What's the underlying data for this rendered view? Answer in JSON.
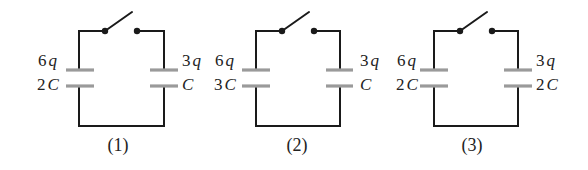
{
  "diagram": {
    "type": "capacitor circuits with open switch",
    "circuits": [
      {
        "caption": "(1)",
        "left": {
          "charge_num": "6",
          "charge_var": "q",
          "cap_num": "2",
          "cap_var": "C"
        },
        "right": {
          "charge_num": "3",
          "charge_var": "q",
          "cap_num": "",
          "cap_var": "C"
        },
        "switch": "open"
      },
      {
        "caption": "(2)",
        "left": {
          "charge_num": "6",
          "charge_var": "q",
          "cap_num": "3",
          "cap_var": "C"
        },
        "right": {
          "charge_num": "3",
          "charge_var": "q",
          "cap_num": "",
          "cap_var": "C"
        },
        "switch": "open"
      },
      {
        "caption": "(3)",
        "left": {
          "charge_num": "6",
          "charge_var": "q",
          "cap_num": "2",
          "cap_var": "C"
        },
        "right": {
          "charge_num": "3",
          "charge_var": "q",
          "cap_num": "2",
          "cap_var": "C"
        },
        "switch": "open"
      }
    ],
    "colors": {
      "wire": "#1a1a1a",
      "plate": "#9a9a9a",
      "background": "#ffffff"
    }
  }
}
